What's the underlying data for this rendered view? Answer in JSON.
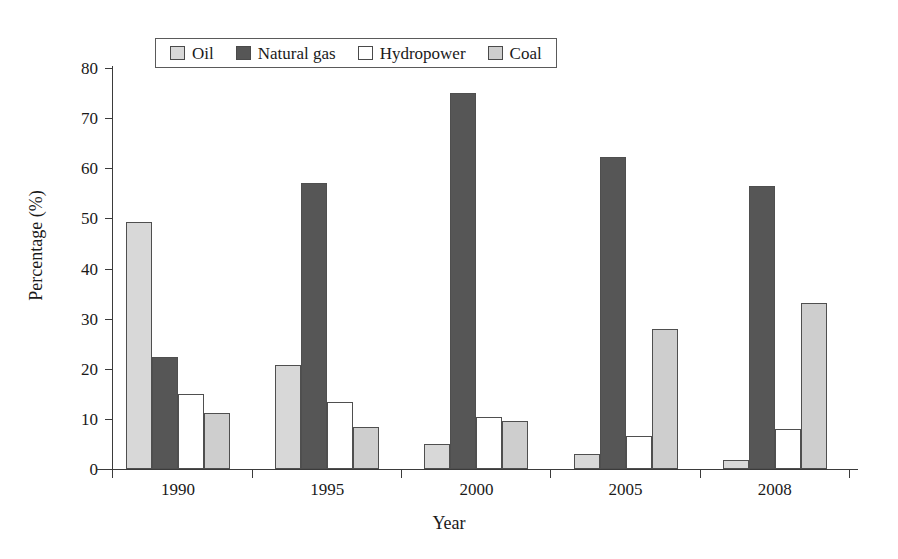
{
  "chart_data": {
    "type": "bar",
    "title": "",
    "subtitle": "",
    "xlabel": "Year",
    "ylabel": "Percentage (%)",
    "categories": [
      "1990",
      "1995",
      "2000",
      "2005",
      "2008"
    ],
    "ylim": [
      0,
      80
    ],
    "yticks": [
      0,
      10,
      20,
      30,
      40,
      50,
      60,
      70,
      80
    ],
    "ytick_labels": [
      "0",
      "10",
      "20",
      "30",
      "40",
      "50",
      "60",
      "70",
      "80"
    ],
    "grid": false,
    "legend_position": "top-center",
    "series": [
      {
        "name": "Oil",
        "color": "#d8d8d8",
        "values": [
          49.2,
          20.7,
          4.9,
          2.9,
          1.7
        ]
      },
      {
        "name": "Natural gas",
        "color": "#565656",
        "values": [
          22.3,
          57.0,
          75.0,
          62.2,
          56.5
        ]
      },
      {
        "name": "Hydropower",
        "color": "#ffffff",
        "values": [
          15.0,
          13.4,
          10.3,
          6.5,
          7.9
        ]
      },
      {
        "name": "Coal",
        "color": "#cecece",
        "values": [
          11.1,
          8.4,
          9.6,
          27.9,
          33.2
        ]
      }
    ]
  },
  "legend": {
    "items": [
      {
        "label": "Oil",
        "color": "#d8d8d8"
      },
      {
        "label": "Natural gas",
        "color": "#565656"
      },
      {
        "label": "Hydropower",
        "color": "#ffffff"
      },
      {
        "label": "Coal",
        "color": "#cecece"
      }
    ]
  },
  "axes": {
    "y_title": "Percentage (%)",
    "x_title": "Year"
  }
}
